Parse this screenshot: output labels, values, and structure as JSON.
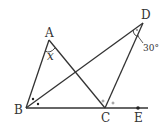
{
  "diagram": {
    "type": "geometry",
    "points": {
      "A": {
        "label": "A",
        "x": 49,
        "y": 40
      },
      "B": {
        "label": "B",
        "x": 26,
        "y": 108
      },
      "C": {
        "label": "C",
        "x": 105,
        "y": 108
      },
      "D": {
        "label": "D",
        "x": 143,
        "y": 23
      },
      "E": {
        "label": "E",
        "x": 138,
        "y": 108
      }
    },
    "segments": [
      "AB",
      "AC",
      "BD",
      "CD",
      "BE"
    ],
    "angles": {
      "at_A": {
        "label": "x",
        "italic": true
      },
      "at_D": {
        "label": "30°"
      }
    },
    "markers": {
      "B_bisector": "two dots marking equal angles ∠ABD = ∠DBC",
      "C_bisector": "two small circles marking equal angles ∠ACD = ∠DCE"
    }
  }
}
